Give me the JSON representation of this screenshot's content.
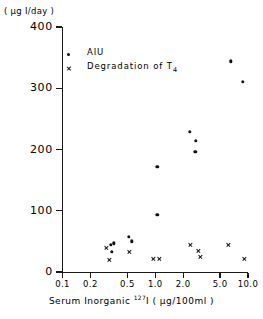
{
  "chart_data": {
    "type": "scatter",
    "title": "",
    "xlabel": "Serum Inorganic 127I ( µg/100ml )",
    "xlabel_prefix": "Serum  Inorganic  ",
    "xlabel_superscript": "127",
    "xlabel_suffix": "I ( µg/100ml )",
    "ylabel": "( µg I/day )",
    "xscale": "log",
    "yscale": "linear",
    "xlim": [
      0.1,
      10.0
    ],
    "ylim": [
      0,
      400
    ],
    "grid": false,
    "legend_position": "upper-left",
    "xticks": [
      0.1,
      0.2,
      0.5,
      1.0,
      2.0,
      5.0,
      10.0
    ],
    "xtick_labels": [
      "0.1",
      "0.2",
      "0.5",
      "1.0",
      "2.0",
      "5.0",
      "10.0"
    ],
    "yticks": [
      0,
      100,
      200,
      300,
      400
    ],
    "ytick_labels": [
      "0",
      "100",
      "200",
      "300",
      "400"
    ],
    "series": [
      {
        "name": "AIU",
        "marker": "filled-circle",
        "color": "#111111",
        "points": [
          {
            "x": 0.33,
            "y": 44
          },
          {
            "x": 0.34,
            "y": 33
          },
          {
            "x": 0.36,
            "y": 47
          },
          {
            "x": 0.52,
            "y": 57
          },
          {
            "x": 0.56,
            "y": 50
          },
          {
            "x": 1.05,
            "y": 93
          },
          {
            "x": 1.05,
            "y": 172
          },
          {
            "x": 2.35,
            "y": 229
          },
          {
            "x": 2.75,
            "y": 214
          },
          {
            "x": 2.7,
            "y": 196
          },
          {
            "x": 6.5,
            "y": 344
          },
          {
            "x": 8.8,
            "y": 311
          }
        ]
      },
      {
        "name": "Degradation of T4",
        "marker": "cross",
        "color": "#111111",
        "points": [
          {
            "x": 0.3,
            "y": 39
          },
          {
            "x": 0.32,
            "y": 20
          },
          {
            "x": 0.52,
            "y": 33
          },
          {
            "x": 0.95,
            "y": 22
          },
          {
            "x": 1.1,
            "y": 21
          },
          {
            "x": 2.4,
            "y": 44
          },
          {
            "x": 2.95,
            "y": 35
          },
          {
            "x": 3.05,
            "y": 24
          },
          {
            "x": 6.1,
            "y": 44
          },
          {
            "x": 9.2,
            "y": 21
          }
        ]
      }
    ]
  },
  "legend": {
    "entries": [
      {
        "label": "AIU",
        "marker": "filled-circle"
      },
      {
        "label": "Degradation of T",
        "subscript": "4",
        "marker": "cross"
      }
    ]
  }
}
